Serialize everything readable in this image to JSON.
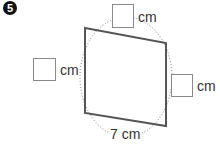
{
  "problem": {
    "number_label": "5",
    "unit": "cm"
  },
  "diagram": {
    "shape": "parallelogram",
    "vertices": [
      [
        85,
        28
      ],
      [
        166,
        43
      ],
      [
        166,
        126
      ],
      [
        85,
        113
      ]
    ],
    "stroke_color": "#555555",
    "circle_stroke": "#777777",
    "sides": {
      "top": {
        "value": "",
        "unit": "cm"
      },
      "left": {
        "value": "",
        "unit": "cm"
      },
      "right": {
        "value": "",
        "unit": "cm"
      },
      "bottom": {
        "value": "7",
        "unit": "cm",
        "label": "7 cm"
      }
    }
  }
}
